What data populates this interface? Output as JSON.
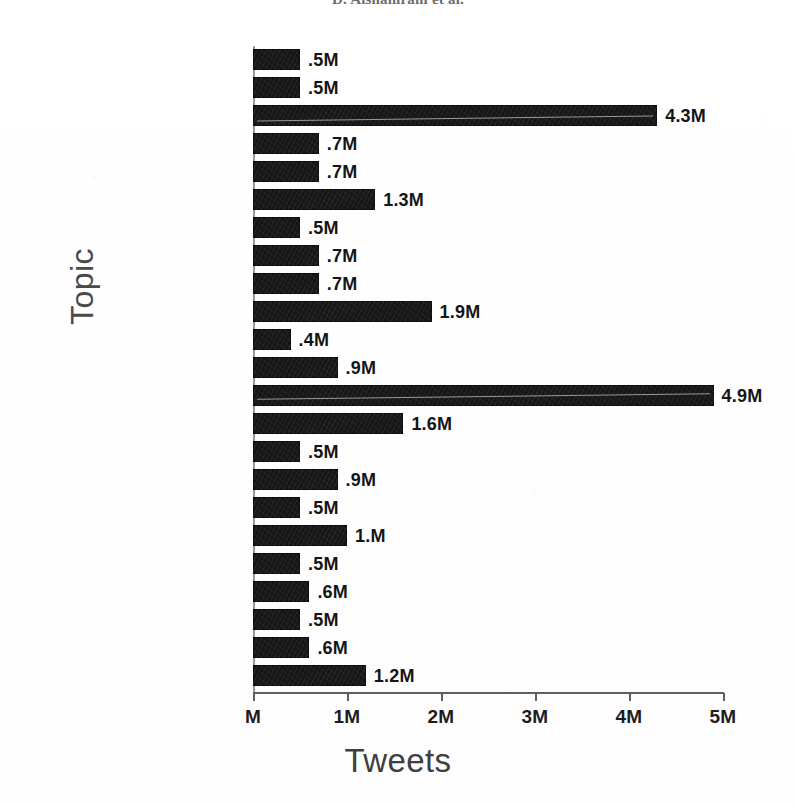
{
  "running_head": "D. Alshamrani et al.",
  "chart_data": {
    "type": "bar",
    "orientation": "horizontal",
    "title": "",
    "xlabel": "Tweets",
    "ylabel": "Topic",
    "grid": false,
    "legend": "none",
    "xlim": [
      0,
      5
    ],
    "xtick_labels": [
      "M",
      "1M",
      "2M",
      "3M",
      "4M",
      "5M"
    ],
    "xtick_values": [
      0,
      1,
      2,
      3,
      4,
      5
    ],
    "unit": "M",
    "categories": [
      "Weather/Travel",
      "Training/Workout",
      "Thoughts/Emotions",
      "Social Media",
      "School/Education",
      "Personal care",
      "Online Shopping/Tickets",
      "Music/Song",
      "Movie/TV",
      "Insult/Mockery",
      "Health Services",
      "Game/Sport",
      "Family/Social Life",
      "Everyday life",
      "Economy",
      "Drink/Food",
      "Customer Supports",
      "Crime/Violence",
      "Covid-19/Pandemic",
      "Celebration/Holiday",
      "Books/Stories",
      "Art/Photography",
      "Politics"
    ],
    "values": [
      0.5,
      0.5,
      4.3,
      0.7,
      0.7,
      1.3,
      0.5,
      0.7,
      0.7,
      1.9,
      0.4,
      0.9,
      4.9,
      1.6,
      0.5,
      0.9,
      0.5,
      1.0,
      0.5,
      0.6,
      0.5,
      0.6,
      1.2
    ],
    "value_labels": [
      ".5M",
      ".5M",
      "4.3M",
      ".7M",
      ".7M",
      "1.3M",
      ".5M",
      ".7M",
      ".7M",
      "1.9M",
      ".4M",
      ".9M",
      "4.9M",
      "1.6M",
      ".5M",
      ".9M",
      ".5M",
      "1.M",
      ".5M",
      ".6M",
      ".5M",
      ".6M",
      "1.2M"
    ],
    "bar_color": "#161616"
  }
}
